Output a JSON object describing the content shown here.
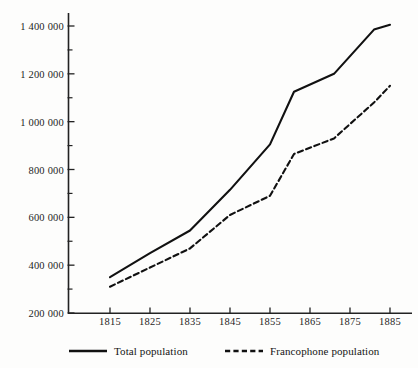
{
  "chart_data": {
    "type": "line",
    "title": "",
    "xlabel": "",
    "ylabel": "",
    "x": [
      1815,
      1825,
      1835,
      1845,
      1855,
      1861,
      1871,
      1881,
      1885
    ],
    "categories": [
      "1815",
      "1825",
      "1835",
      "1845",
      "1855",
      "1865",
      "1875",
      "1885"
    ],
    "xlim": [
      1810,
      1889
    ],
    "ylim": [
      200000,
      1450000
    ],
    "grid": false,
    "legend_position": "bottom",
    "xticks": [
      1815,
      1825,
      1835,
      1845,
      1855,
      1865,
      1875,
      1885
    ],
    "xtick_labels": [
      "1815",
      "1825",
      "1835",
      "1845",
      "1855",
      "1865",
      "1875",
      "1885"
    ],
    "yticks": [
      200000,
      400000,
      600000,
      800000,
      1000000,
      1200000,
      1400000
    ],
    "ytick_labels": [
      "200 000",
      "400 000",
      "600 000",
      "800 000",
      "1 000 000",
      "1 200 000",
      "1 400 000"
    ],
    "yminor_ticks": [
      300000,
      500000,
      700000,
      900000,
      1100000,
      1300000
    ],
    "series": [
      {
        "name": "Total population",
        "style": "solid",
        "color": "#111111",
        "x": [
          1815,
          1825,
          1835,
          1845,
          1855,
          1861,
          1871,
          1881,
          1885
        ],
        "values": [
          350000,
          450000,
          545000,
          715000,
          905000,
          1125000,
          1200000,
          1385000,
          1405000
        ]
      },
      {
        "name": "Francophone population",
        "style": "dashed",
        "color": "#111111",
        "x": [
          1815,
          1825,
          1835,
          1845,
          1855,
          1861,
          1871,
          1881,
          1885
        ],
        "values": [
          310000,
          390000,
          470000,
          610000,
          690000,
          865000,
          930000,
          1080000,
          1150000
        ]
      }
    ]
  },
  "legend": {
    "items": [
      {
        "label": "Total population",
        "style": "solid"
      },
      {
        "label": "Francophone population",
        "style": "dashed"
      }
    ]
  },
  "axes": {
    "y_axis_name": "population-axis",
    "x_axis_name": "year-axis"
  }
}
